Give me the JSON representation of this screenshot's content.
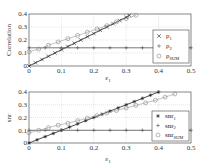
{
  "chart_data": [
    {
      "type": "line",
      "title": "",
      "xlabel": "ε1",
      "ylabel": "Correlation",
      "xlim": [
        0,
        0.5
      ],
      "ylim": [
        0,
        0.4
      ],
      "xticks": [
        "0",
        "0.1",
        "0.2",
        "0.3",
        "0.4",
        "0.5"
      ],
      "yticks": [
        "0",
        "0.1",
        "0.2",
        "0.3",
        "0.4"
      ],
      "grid": true,
      "legend_position": "lower right",
      "series": [
        {
          "name": "ρ1",
          "marker": "x",
          "x": [
            0,
            0.02,
            0.04,
            0.06,
            0.08,
            0.1,
            0.12,
            0.14,
            0.16,
            0.18,
            0.2,
            0.22,
            0.24,
            0.26,
            0.28,
            0.3,
            0.31
          ],
          "values": [
            0,
            0.025,
            0.05,
            0.075,
            0.1,
            0.125,
            0.15,
            0.175,
            0.2,
            0.225,
            0.25,
            0.275,
            0.3,
            0.325,
            0.35,
            0.375,
            0.39
          ]
        },
        {
          "name": "ρ2",
          "marker": "+",
          "x": [
            0,
            0.05,
            0.1,
            0.15,
            0.2,
            0.25,
            0.3,
            0.35,
            0.4,
            0.45,
            0.5
          ],
          "values": [
            0.14,
            0.14,
            0.14,
            0.14,
            0.14,
            0.14,
            0.14,
            0.14,
            0.14,
            0.14,
            0.14
          ]
        },
        {
          "name": "ρSUM",
          "marker": "o",
          "x": [
            0,
            0.03,
            0.06,
            0.09,
            0.12,
            0.15,
            0.18,
            0.21,
            0.24,
            0.27,
            0.3,
            0.33
          ],
          "values": [
            0.11,
            0.13,
            0.16,
            0.185,
            0.21,
            0.235,
            0.26,
            0.285,
            0.31,
            0.34,
            0.365,
            0.39
          ]
        }
      ]
    },
    {
      "type": "line",
      "title": "",
      "xlabel": "ε1",
      "ylabel": "snr",
      "xlim": [
        0,
        0.5
      ],
      "ylim": [
        0,
        0.4
      ],
      "xticks": [
        "0",
        "0.1",
        "0.2",
        "0.3",
        "0.4",
        "0.5"
      ],
      "yticks": [
        "0",
        "0.1",
        "0.2",
        "0.3",
        "0.4"
      ],
      "grid": true,
      "legend_position": "lower right",
      "series": [
        {
          "name": "snr1",
          "marker": "*",
          "x": [
            0,
            0.025,
            0.05,
            0.075,
            0.1,
            0.125,
            0.15,
            0.175,
            0.2,
            0.225,
            0.25,
            0.275,
            0.3,
            0.325,
            0.35,
            0.375,
            0.4
          ],
          "values": [
            0,
            0.025,
            0.05,
            0.075,
            0.1,
            0.125,
            0.15,
            0.175,
            0.2,
            0.225,
            0.25,
            0.275,
            0.3,
            0.325,
            0.35,
            0.375,
            0.4
          ]
        },
        {
          "name": "snr2",
          "marker": "+",
          "x": [
            0,
            0.05,
            0.1,
            0.15,
            0.2,
            0.25,
            0.3,
            0.35,
            0.4,
            0.45,
            0.5
          ],
          "values": [
            0.1,
            0.1,
            0.1,
            0.1,
            0.1,
            0.1,
            0.1,
            0.1,
            0.1,
            0.1,
            0.1
          ]
        },
        {
          "name": "snrSUM",
          "marker": "o",
          "x": [
            0,
            0.03,
            0.06,
            0.09,
            0.12,
            0.15,
            0.18,
            0.21,
            0.24,
            0.27,
            0.3,
            0.33,
            0.36,
            0.39,
            0.42,
            0.45
          ],
          "values": [
            0.08,
            0.1,
            0.12,
            0.14,
            0.155,
            0.175,
            0.195,
            0.215,
            0.235,
            0.255,
            0.275,
            0.295,
            0.315,
            0.335,
            0.36,
            0.385
          ]
        }
      ]
    }
  ],
  "top": {
    "ylabel": "Correlation",
    "xlabel_main": "ε",
    "xlabel_sub": "1",
    "legend": [
      {
        "main": "ρ",
        "sub": "1"
      },
      {
        "main": "ρ",
        "sub": "2"
      },
      {
        "main": "ρ",
        "sub": "SUM"
      }
    ]
  },
  "bottom": {
    "ylabel": "snr",
    "xlabel_main": "ε",
    "xlabel_sub": "1",
    "legend": [
      {
        "main": "snr",
        "sub": "1"
      },
      {
        "main": "snr",
        "sub": "2"
      },
      {
        "main": "snr",
        "sub": "SUM"
      }
    ]
  },
  "ticks": {
    "x": [
      "0",
      "0.1",
      "0.2",
      "0.3",
      "0.4",
      "0.5"
    ],
    "y": [
      "0",
      "0.1",
      "0.2",
      "0.3",
      "0.4"
    ]
  }
}
